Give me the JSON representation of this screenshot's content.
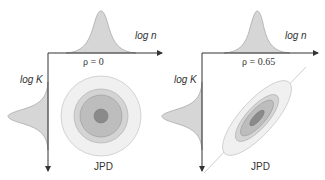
{
  "panels": [
    {
      "id": "uncorrelated",
      "x_axis_label": "log n",
      "y_axis_label": "log K",
      "correlation_label": "ρ = 0",
      "joint_label": "JPD",
      "correlation": 0
    },
    {
      "id": "correlated",
      "x_axis_label": "log n",
      "y_axis_label": "log K",
      "correlation_label": "ρ = 0.65",
      "joint_label": "JPD",
      "correlation": 0.65
    }
  ],
  "colors": {
    "axis": "#333333",
    "marginal_fill": "#d6d6d6",
    "marginal_stroke": "#aaaaaa",
    "contour_outer": "#f0f0f0",
    "contour_2": "#d4d4d4",
    "contour_3": "#bdbdbd",
    "contour_core": "#8a8a8a",
    "regression_line": "#cfcfcf"
  }
}
